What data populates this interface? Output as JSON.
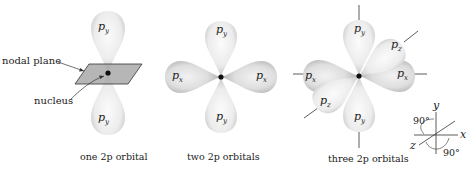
{
  "figure": {
    "panels": [
      {
        "id": "one",
        "caption": "one 2p orbital",
        "lobes": [
          "p_y",
          "p_y"
        ],
        "labels": {
          "nodal_plane": "nodal plane",
          "nucleus": "nucleus"
        }
      },
      {
        "id": "two",
        "caption": "two 2p orbitals",
        "lobes": [
          "p_y",
          "p_x",
          "p_x",
          "p_y"
        ]
      },
      {
        "id": "three",
        "caption": "three 2p orbitals",
        "lobes": [
          "p_y",
          "p_z",
          "p_x",
          "p_x",
          "p_z",
          "p_y"
        ]
      }
    ],
    "axes": {
      "x_label": "x",
      "y_label": "y",
      "z_label": "z",
      "angle_top": "90°",
      "angle_bottom": "90°"
    },
    "text": {
      "p": "p",
      "sub_x": "x",
      "sub_y": "y",
      "sub_z": "z"
    },
    "colors": {
      "lobe_light": "#f4f4f4",
      "lobe_shade": "#c9c9c9",
      "plane": "#a9a9a9",
      "ink": "#222222"
    }
  }
}
